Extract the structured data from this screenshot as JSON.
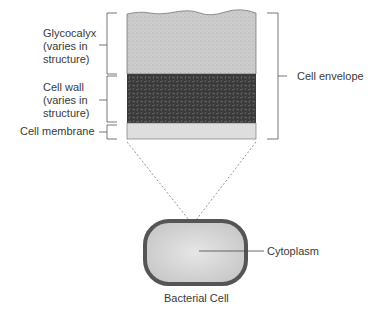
{
  "diagram": {
    "layers": [
      {
        "name": "Glycocalyx",
        "label_lines": [
          "Glycocalyx",
          "(varies in",
          "structure)"
        ],
        "color": "#c8c8c8"
      },
      {
        "name": "Cell wall",
        "label_lines": [
          "Cell wall",
          "(varies in",
          "structure)"
        ],
        "color": "#3c3c3c"
      },
      {
        "name": "Cell membrane",
        "label_lines": [
          "Cell membrane"
        ],
        "color": "#dcdcdc"
      }
    ],
    "envelope_label": "Cell envelope",
    "cytoplasm_label": "Cytoplasm",
    "cell_caption": "Bacterial Cell",
    "colors": {
      "glycocalyx": "#c8c8c8",
      "cell_wall": "#3c3c3c",
      "membrane": "#dcdcdc",
      "cell_outline": "#555555",
      "cytoplasm": "#d6d6d6"
    }
  }
}
